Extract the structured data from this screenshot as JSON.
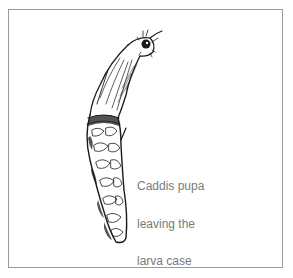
{
  "figure": {
    "caption_lines": [
      "Caddis pupa",
      "leaving the",
      "larva case"
    ],
    "subject_icon": "caddis-pupa-illustration",
    "border_color": "#9a9a9a",
    "ink_color": "#1a1a1a",
    "caption_color": "#7a7a7a"
  }
}
